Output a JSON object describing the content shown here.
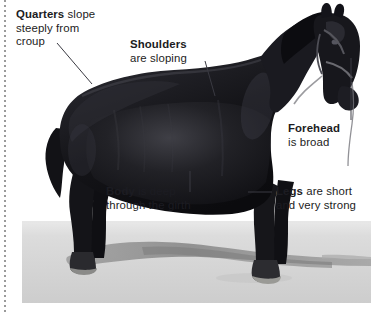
{
  "figure": {
    "background_color": "#ffffff",
    "text_color": "#1c1c22",
    "rule_color": "#9a9a9a"
  },
  "callouts": [
    {
      "name": "quarters",
      "line1_bold": "Quarters",
      "line1_rest": " slope",
      "line2": "steeply from",
      "line3": "croup"
    },
    {
      "name": "shoulders",
      "line1_bold": "Shoulders",
      "line1_rest": "",
      "line2": "are sloping",
      "line3": ""
    },
    {
      "name": "forehead",
      "line1_bold": "Forehead",
      "line1_rest": "",
      "line2": "is broad",
      "line3": ""
    },
    {
      "name": "body",
      "line1_bold": "Body",
      "line1_rest": " is deep",
      "line2": "through the girth",
      "line3": ""
    },
    {
      "name": "legs",
      "line1_bold": "Legs",
      "line1_rest": " are short",
      "line2": "and very strong",
      "line3": ""
    }
  ],
  "photo": {
    "alt": "black draught horse standing in profile facing right on pale sandy ground",
    "ground_color": "#d2d2d2",
    "sky_color": "#f2f2f2",
    "horse_color": "#15151a",
    "shadow_color": "#8d8d8d"
  }
}
